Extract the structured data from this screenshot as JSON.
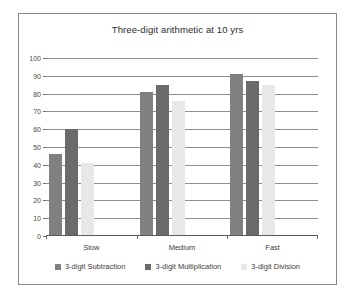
{
  "chart_data": {
    "type": "bar",
    "title": "Three-digit arithmetic at 10 yrs",
    "xlabel": "",
    "ylabel": "",
    "categories": [
      "Slow",
      "Medium",
      "Fast"
    ],
    "series": [
      {
        "name": "3-digit Subtraction",
        "values": [
          46,
          81,
          91
        ],
        "color": "#808080"
      },
      {
        "name": "3-digit Multiplication",
        "values": [
          60,
          85,
          87
        ],
        "color": "#6b6b6b"
      },
      {
        "name": "3-digit Division",
        "values": [
          41,
          76,
          85
        ],
        "color": "#e8e8e8"
      }
    ],
    "ylim": [
      0,
      100
    ],
    "yticks": [
      0,
      10,
      20,
      30,
      40,
      50,
      60,
      70,
      80,
      90,
      100
    ],
    "ytick_labels": [
      "0",
      "10",
      "20",
      "30",
      "40",
      "50",
      "60",
      "70",
      "80",
      "90",
      "100"
    ],
    "grid": true,
    "legend_position": "bottom"
  },
  "frame": {
    "border_color": "#8a8a8a"
  }
}
